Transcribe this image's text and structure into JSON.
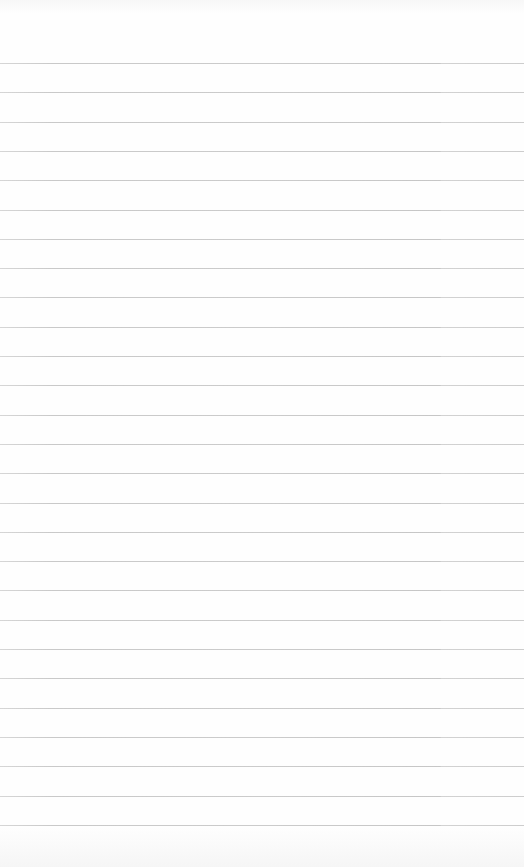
{
  "page": {
    "type": "ruled-paper",
    "background_color": "#fefefe",
    "rule_color": "#c9c9c9",
    "rule_count": 27,
    "first_rule_y": 63,
    "rule_spacing": 29.3
  }
}
